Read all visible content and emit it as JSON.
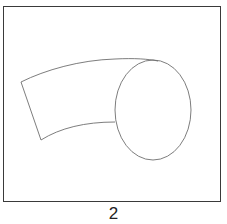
{
  "figure": {
    "caption": "2",
    "stroke_color": "#6e6e6e",
    "frame_color": "#3a3a3a",
    "shapes": [
      {
        "type": "ellipse",
        "name": "cylinder-end-face",
        "cx": 153,
        "cy": 110,
        "rx": 38,
        "ry": 50
      },
      {
        "type": "path",
        "name": "curved-tube-body",
        "description": "curved band from left edge to ellipse"
      }
    ]
  }
}
